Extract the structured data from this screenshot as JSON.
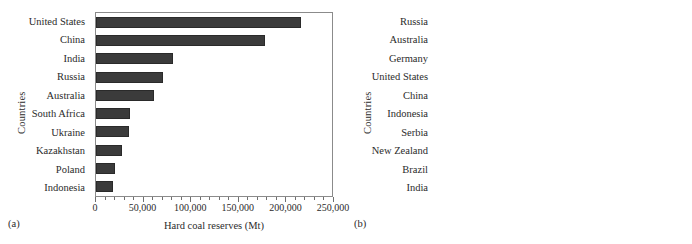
{
  "figure": {
    "width": 692,
    "height": 244,
    "background": "#ffffff"
  },
  "panels": [
    {
      "tag": "(a)",
      "bar_color": "#3b3b3b",
      "bar_edge": "#2a2a2a",
      "chart_data": {
        "type": "bar",
        "orientation": "horizontal",
        "title": "",
        "xlabel": "Hard coal reserves (Mt)",
        "ylabel": "Countries",
        "xlim": [
          0,
          250000
        ],
        "xticks": [
          0,
          50000,
          100000,
          150000,
          200000,
          250000
        ],
        "xticklabels": [
          "0",
          "50,000",
          "100,000",
          "150,000",
          "200,000",
          "250,000"
        ],
        "minor_ticks_per_interval": 5,
        "grid": false,
        "legend": "none",
        "categories": [
          "United States",
          "China",
          "India",
          "Russia",
          "Australia",
          "South Africa",
          "Ukraine",
          "Kazakhstan",
          "Poland",
          "Indonesia"
        ],
        "values": [
          217000,
          179000,
          81500,
          71500,
          61000,
          36500,
          34500,
          28000,
          20000,
          17500
        ]
      }
    },
    {
      "tag": "(b)",
      "bar_color": "#c9c9c9",
      "bar_edge": "#6d6d6d",
      "chart_data": {
        "type": "bar",
        "orientation": "horizontal",
        "title": "",
        "xlabel": "Lignite coal reserves (Mt)",
        "ylabel": "Countries",
        "xlim": [
          0,
          100000
        ],
        "xticks": [
          0,
          25000,
          50000,
          75000,
          100000
        ],
        "xticklabels": [
          "0",
          "25,000",
          "50,000",
          "75,000",
          "100,000"
        ],
        "minor_ticks_per_interval": 5,
        "grid": false,
        "legend": "none",
        "categories": [
          "Russia",
          "Australia",
          "Germany",
          "United States",
          "China",
          "Indonesia",
          "Serbia",
          "New Zealand",
          "Brazil",
          "India"
        ],
        "values": [
          91000,
          44300,
          40300,
          31700,
          12100,
          9500,
          7400,
          7100,
          5000,
          4500
        ]
      }
    }
  ]
}
